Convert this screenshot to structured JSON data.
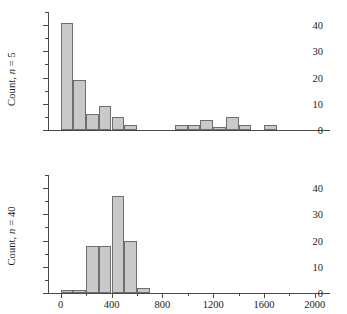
{
  "figure": {
    "background_color": "#ffffff",
    "bar_fill_color": "#c9c9c9",
    "bar_edge_color": "#6e6e6e",
    "axis_color": "#4a4a4a"
  },
  "axis": {
    "xlabel": "Sample means",
    "x_ticks": [
      0,
      400,
      800,
      1200,
      1600,
      2000
    ],
    "x_tick_labels": [
      "0",
      "400",
      "800",
      "1200",
      "1600",
      "2000"
    ],
    "x_minor_ticks": [
      200,
      600,
      1000,
      1400,
      1800
    ],
    "y_ticks": [
      0,
      10,
      20,
      30,
      40
    ],
    "y_tick_labels": [
      "0",
      "10",
      "20",
      "30",
      "40"
    ],
    "y_minor_ticks": [
      5,
      15,
      25,
      35,
      45
    ]
  },
  "chart_data": [
    {
      "type": "bar",
      "title": "",
      "panel": "top",
      "ylabel_prefix": "Count, ",
      "ylabel_italic": "n",
      "ylabel_suffix": " = 5",
      "ylabel_text": "Count, n = 5",
      "xlabel": "Sample means",
      "xlim": [
        -100,
        2120
      ],
      "ylim": [
        0,
        45
      ],
      "bin_width": 100,
      "grid": false,
      "legend": "none",
      "bins": [
        {
          "left": 0,
          "right": 100,
          "value": 41
        },
        {
          "left": 100,
          "right": 200,
          "value": 19
        },
        {
          "left": 200,
          "right": 300,
          "value": 6
        },
        {
          "left": 300,
          "right": 400,
          "value": 9
        },
        {
          "left": 400,
          "right": 500,
          "value": 5
        },
        {
          "left": 500,
          "right": 600,
          "value": 2
        },
        {
          "left": 900,
          "right": 1000,
          "value": 2
        },
        {
          "left": 1000,
          "right": 1100,
          "value": 2
        },
        {
          "left": 1100,
          "right": 1200,
          "value": 4
        },
        {
          "left": 1200,
          "right": 1300,
          "value": 1
        },
        {
          "left": 1300,
          "right": 1400,
          "value": 5
        },
        {
          "left": 1400,
          "right": 1500,
          "value": 2
        },
        {
          "left": 1600,
          "right": 1700,
          "value": 2
        }
      ]
    },
    {
      "type": "bar",
      "title": "",
      "panel": "bottom",
      "ylabel_prefix": "Count, ",
      "ylabel_italic": "n",
      "ylabel_suffix": " = 40",
      "ylabel_text": "Count, n = 40",
      "xlabel": "Sample means",
      "xlim": [
        -100,
        2120
      ],
      "ylim": [
        0,
        45
      ],
      "bin_width": 100,
      "grid": false,
      "legend": "none",
      "bins": [
        {
          "left": 0,
          "right": 100,
          "value": 1
        },
        {
          "left": 100,
          "right": 200,
          "value": 1
        },
        {
          "left": 200,
          "right": 300,
          "value": 18
        },
        {
          "left": 300,
          "right": 400,
          "value": 18
        },
        {
          "left": 400,
          "right": 500,
          "value": 37
        },
        {
          "left": 500,
          "right": 600,
          "value": 20
        },
        {
          "left": 600,
          "right": 700,
          "value": 2
        }
      ]
    }
  ]
}
